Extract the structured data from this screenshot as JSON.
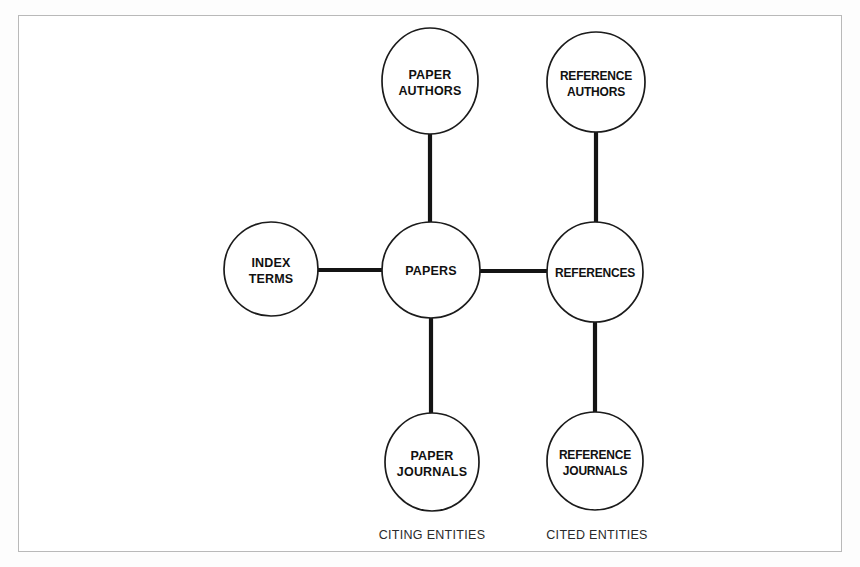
{
  "figure": {
    "kind": "entity-relationship-diagram",
    "background_color": "#fdfdfd",
    "frame_color": "#b9b9b9",
    "node_fill": "#ffffff",
    "node_stroke": "#1b1b1b",
    "edge_color": "#141414"
  },
  "nodes": [
    {
      "id": "paper-authors",
      "lines": [
        "PAPER",
        "AUTHORS"
      ],
      "line1": "PAPER",
      "line2": "AUTHORS",
      "cx": 430,
      "cy": 81,
      "rx": 48,
      "ry": 53,
      "tight": false
    },
    {
      "id": "reference-authors",
      "lines": [
        "REFERENCE",
        "AUTHORS"
      ],
      "line1": "REFERENCE",
      "line2": "AUTHORS",
      "cx": 596,
      "cy": 82,
      "rx": 49,
      "ry": 50,
      "tight": true
    },
    {
      "id": "index-terms",
      "lines": [
        "INDEX",
        "TERMS"
      ],
      "line1": "INDEX",
      "line2": "TERMS",
      "cx": 271,
      "cy": 269,
      "rx": 47,
      "ry": 47,
      "tight": false
    },
    {
      "id": "papers",
      "lines": [
        "PAPERS"
      ],
      "line1": "PAPERS",
      "line2": "",
      "cx": 431,
      "cy": 270,
      "rx": 49,
      "ry": 48,
      "tight": false
    },
    {
      "id": "references",
      "lines": [
        "REFERENCES"
      ],
      "line1": "REFERENCES",
      "line2": "",
      "cx": 595,
      "cy": 272,
      "rx": 48,
      "ry": 50,
      "tight": true
    },
    {
      "id": "paper-journals",
      "lines": [
        "PAPER",
        "JOURNALS"
      ],
      "line1": "PAPER",
      "line2": "JOURNALS",
      "cx": 432,
      "cy": 462,
      "rx": 47,
      "ry": 49,
      "tight": false
    },
    {
      "id": "reference-journals",
      "lines": [
        "REFERENCE",
        "JOURNALS"
      ],
      "line1": "REFERENCE",
      "line2": "JOURNALS",
      "cx": 595,
      "cy": 461,
      "rx": 48,
      "ry": 49,
      "tight": true
    }
  ],
  "edges": [
    {
      "id": "paper-authors-to-papers",
      "from": "paper-authors",
      "to": "papers",
      "x1": 430,
      "y1": 134,
      "x2": 430,
      "y2": 222
    },
    {
      "id": "reference-authors-to-references",
      "from": "reference-authors",
      "to": "references",
      "x1": 596,
      "y1": 132,
      "x2": 596,
      "y2": 222
    },
    {
      "id": "index-terms-to-papers",
      "from": "index-terms",
      "to": "papers",
      "x1": 318,
      "y1": 270,
      "x2": 382,
      "y2": 270
    },
    {
      "id": "papers-to-references",
      "from": "papers",
      "to": "references",
      "x1": 480,
      "y1": 271,
      "x2": 547,
      "y2": 271
    },
    {
      "id": "papers-to-paper-journals",
      "from": "papers",
      "to": "paper-journals",
      "x1": 431,
      "y1": 318,
      "x2": 431,
      "y2": 413
    },
    {
      "id": "references-to-reference-journals",
      "from": "references",
      "to": "reference-journals",
      "x1": 595,
      "y1": 322,
      "x2": 595,
      "y2": 412
    }
  ],
  "captions": [
    {
      "id": "citing-entities",
      "text": "CITING ENTITIES",
      "x": 432,
      "y": 539
    },
    {
      "id": "cited-entities",
      "text": "CITED ENTITIES",
      "x": 597,
      "y": 539
    }
  ]
}
